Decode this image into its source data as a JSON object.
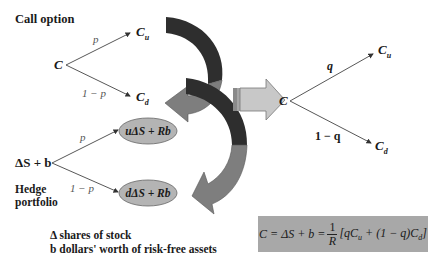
{
  "call_option": {
    "title": "Call option",
    "root": "C",
    "up": "C",
    "up_sub": "u",
    "down": "C",
    "down_sub": "d",
    "prob_up": "p",
    "prob_down": "1 − p"
  },
  "hedge_portfolio": {
    "root": "ΔS + b",
    "up_value": "uΔS + Rb",
    "down_value": "dΔS + Rb",
    "prob_up": "p",
    "prob_down": "1 − p",
    "label_line1": "Hedge",
    "label_line2": "portfolio"
  },
  "legend": {
    "line1": "Δ shares of stock",
    "line2": "b dollars' worth of risk-free assets"
  },
  "risk_neutral": {
    "root": "C",
    "up": "C",
    "up_sub": "u",
    "down": "C",
    "down_sub": "d",
    "prob_up": "q",
    "prob_down": "1 − q"
  },
  "formula": {
    "lhs": "C = ΔS + b = ",
    "frac_num": "1",
    "frac_den": "R",
    "rhs_open": "[qC",
    "rhs_sub1": "u",
    "rhs_mid": " + (1 − q)C",
    "rhs_sub2": "d",
    "rhs_close": "]"
  },
  "colors": {
    "dark_arrow": "#2e2e2e",
    "mid_arrow": "#7e7e7e",
    "ellipse_fill": "#b4b4b4",
    "right_arrow_fill": "#c8c8c8",
    "formula_bg": "#a8a8a8"
  }
}
